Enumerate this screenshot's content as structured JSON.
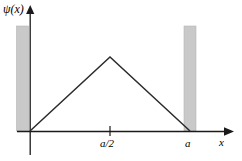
{
  "figure": {
    "title": "",
    "axis_label_y": "ψ(x)",
    "axis_label_x": "x",
    "tick_mid": "a/2",
    "tick_end": "a",
    "colors": {
      "background": "#ffffff",
      "axis": "#1a1a1a",
      "curve": "#2b2b2b",
      "wall_fill": "#c9c9c9",
      "wall_edge": "#9a9a9a"
    }
  },
  "chart_data": {
    "type": "line",
    "title": "",
    "xlabel": "x",
    "ylabel": "ψ(x)",
    "x": [
      0,
      0.5,
      1
    ],
    "series": [
      {
        "name": "ψ(x)",
        "values": [
          0,
          1,
          0
        ]
      }
    ],
    "xtick_values": [
      0.5,
      1
    ],
    "xtick_labels": [
      "a/2",
      "a"
    ],
    "ytick_values": [],
    "ytick_labels": [],
    "xlim": [
      -0.1,
      1.25
    ],
    "ylim": [
      0,
      1.35
    ],
    "grid": false,
    "legend": false,
    "annotations": [
      {
        "name": "left-potential-wall",
        "label": "",
        "x_range": [
          -0.18,
          -0.02
        ],
        "description": "infinite potential barrier left of x=0"
      },
      {
        "name": "right-potential-wall",
        "label": "",
        "x_range": [
          0.96,
          1.12
        ],
        "description": "infinite potential barrier right of x=a"
      }
    ]
  }
}
